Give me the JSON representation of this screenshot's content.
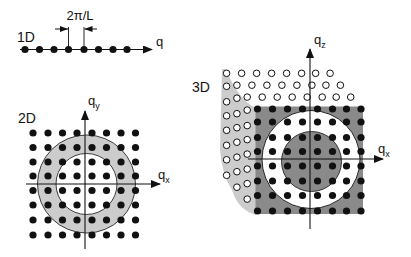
{
  "colors": {
    "ink": "#111111",
    "shell_light": "#cccccc",
    "shell_dark": "#8a8a8a",
    "background": "#ffffff"
  },
  "panel_1d": {
    "label": "1D",
    "axis_label": "q",
    "spacing_label": "2π/L",
    "points_x": [
      25,
      39.5,
      54,
      68.5,
      84,
      98.5,
      113,
      127
    ],
    "axis_y": 49.5
  },
  "panel_2d": {
    "label": "2D",
    "axis_x_label": "q",
    "axis_x_sub": "x",
    "axis_y_label": "q",
    "axis_y_sub": "y",
    "grid_x": [
      33,
      48,
      62.5,
      77,
      92,
      106.5,
      121,
      135.5
    ],
    "grid_y": [
      133,
      147.5,
      162,
      176,
      190.5,
      205,
      220,
      235
    ],
    "shell": {
      "cx": 86.5,
      "cy": 184,
      "r_outer": 49,
      "r_inner": 30.5
    }
  },
  "panel_3d": {
    "label": "3D",
    "axis_x_label": "q",
    "axis_x_sub": "x",
    "axis_z_label": "q",
    "axis_z_sub": "z",
    "front_grid_x": [
      257.5,
      272.5,
      287.5,
      302.5,
      317.5,
      332.5,
      346.5,
      361
    ],
    "front_grid_y": [
      109,
      122,
      137.5,
      151.5,
      166,
      181,
      195.5,
      211
    ],
    "depth_offset": [
      -10.3,
      -11.9
    ],
    "back_layers": 3,
    "outer_sphere": {
      "cx": 311,
      "cy": 159.5,
      "r": 49
    },
    "inner_sphere": {
      "cx": 311.5,
      "cy": 161.5,
      "r": 30
    }
  }
}
